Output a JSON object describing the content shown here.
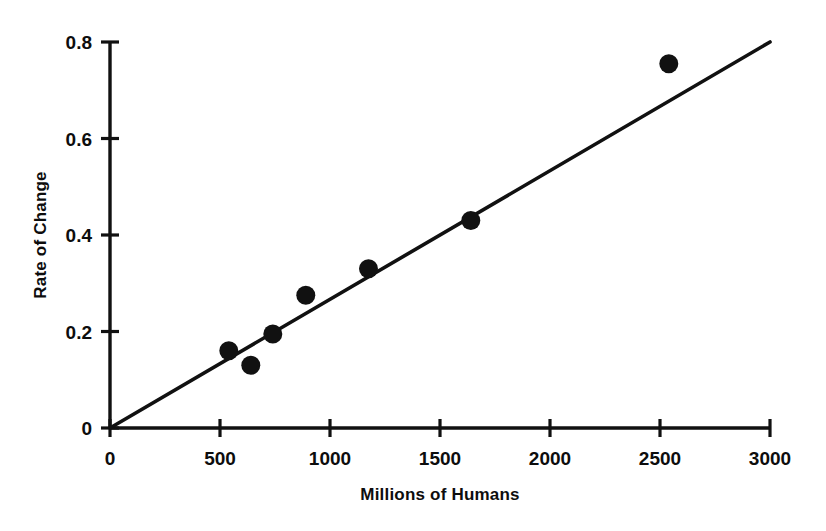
{
  "chart_data": {
    "type": "scatter",
    "title": "",
    "subtitle": "",
    "xlabel": "Millions of Humans",
    "ylabel": "Rate of Change",
    "xlim": [
      0,
      3000
    ],
    "ylim": [
      0,
      0.8
    ],
    "xticks": [
      "0",
      "500",
      "1000",
      "1500",
      "2000",
      "2500",
      "3000"
    ],
    "xtick_values": [
      0,
      500,
      1000,
      1500,
      2000,
      2500,
      3000
    ],
    "yticks": [
      "0",
      "0.2",
      "0.4",
      "0.6",
      "0.8"
    ],
    "ytick_values": [
      0,
      0.2,
      0.4,
      0.6,
      0.8
    ],
    "grid": false,
    "legend": false,
    "legend_position": "none",
    "marker": "filled-circle",
    "marker_color": "#111111",
    "line_color": "#111111",
    "background_color": "#ffffff",
    "series": [
      {
        "name": "Observations",
        "type": "scatter",
        "points": [
          {
            "x": 540,
            "y": 0.16
          },
          {
            "x": 640,
            "y": 0.13
          },
          {
            "x": 740,
            "y": 0.195
          },
          {
            "x": 890,
            "y": 0.275
          },
          {
            "x": 1175,
            "y": 0.33
          },
          {
            "x": 1640,
            "y": 0.43
          },
          {
            "x": 2540,
            "y": 0.755
          }
        ]
      },
      {
        "name": "Trend line",
        "type": "line",
        "points": [
          {
            "x": 0,
            "y": 0.0
          },
          {
            "x": 3000,
            "y": 0.8
          }
        ]
      }
    ]
  }
}
